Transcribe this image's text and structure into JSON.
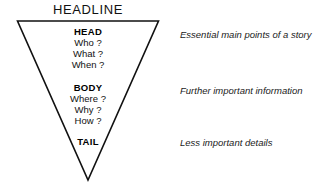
{
  "diagram": {
    "title": "HEADLINE",
    "shape": "inverted-triangle",
    "stroke_color": "#111111",
    "background_color": "#ffffff",
    "tiers": [
      {
        "id": "head",
        "label": "HEAD",
        "questions": [
          "Who ?",
          "What ?",
          "When ?"
        ],
        "note": "Essential main points of a story"
      },
      {
        "id": "body",
        "label": "BODY",
        "questions": [
          "Where ?",
          "Why ?",
          "How ?"
        ],
        "note": "Further important information"
      },
      {
        "id": "tail",
        "label": "TAIL",
        "questions": [],
        "note": "Less important details"
      }
    ]
  }
}
